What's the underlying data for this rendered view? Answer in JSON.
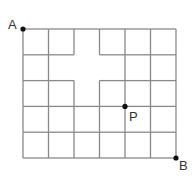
{
  "diagram": {
    "type": "street-grid",
    "columns": 6,
    "rows": 5,
    "origin": {
      "x": 23,
      "y": 29
    },
    "cell_width": 25.5,
    "cell_height": 25.8,
    "line_color": "#888888",
    "point_color": "#111111",
    "missing_segments": [
      {
        "orientation": "h",
        "row_line": 1,
        "from_col": 2,
        "to_col": 3
      },
      {
        "orientation": "h",
        "row_line": 2,
        "from_col": 2,
        "to_col": 3
      },
      {
        "orientation": "v",
        "col_line": 2,
        "from_row": 1,
        "to_row": 2
      },
      {
        "orientation": "v",
        "col_line": 3,
        "from_row": 1,
        "to_row": 2
      }
    ],
    "points": [
      {
        "name": "A",
        "label": "A",
        "col": 0,
        "row": 0
      },
      {
        "name": "P",
        "label": "P",
        "col": 4,
        "row": 3
      },
      {
        "name": "B",
        "label": "B",
        "col": 6,
        "row": 5
      }
    ]
  }
}
